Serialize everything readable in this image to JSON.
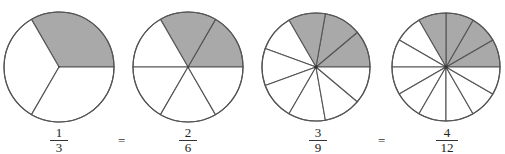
{
  "figure": {
    "colors": {
      "shaded": "#a9a9a9",
      "unshaded": "#ffffff",
      "stroke": "#555555"
    },
    "circles": [
      {
        "id": "one-third",
        "cx": 59,
        "cy": 67,
        "r": 55,
        "slices": 3,
        "shaded": 1,
        "fraction": {
          "numerator": "1",
          "denominator": "3"
        },
        "label_x": 44
      },
      {
        "id": "two-sixths",
        "cx": 188,
        "cy": 67,
        "r": 55,
        "slices": 6,
        "shaded": 2,
        "fraction": {
          "numerator": "2",
          "denominator": "6"
        },
        "label_x": 173
      },
      {
        "id": "three-ninths",
        "cx": 316,
        "cy": 67,
        "r": 54,
        "slices": 9,
        "shaded": 3,
        "fraction": {
          "numerator": "3",
          "denominator": "9"
        },
        "label_x": 303
      },
      {
        "id": "four-twelfths",
        "cx": 446,
        "cy": 67,
        "r": 54,
        "slices": 12,
        "shaded": 4,
        "fraction": {
          "numerator": "4",
          "denominator": "12"
        },
        "label_x": 432
      }
    ],
    "equals": [
      {
        "symbol": "=",
        "x": 118
      },
      {
        "symbol": "=",
        "x": 378
      }
    ]
  }
}
